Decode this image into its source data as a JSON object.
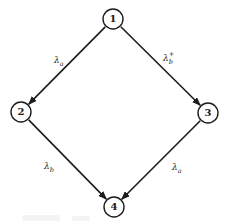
{
  "diagram": {
    "type": "state-transition-graph",
    "background": "#ffffff",
    "stroke_color": "#1c1c1c",
    "node_fill": "#ffffff",
    "node_radius": 10,
    "nodes": [
      {
        "id": "1",
        "label": "1",
        "x": 113,
        "y": 19
      },
      {
        "id": "2",
        "label": "2",
        "x": 21,
        "y": 112
      },
      {
        "id": "3",
        "label": "3",
        "x": 208,
        "y": 113
      },
      {
        "id": "4",
        "label": "4",
        "x": 114,
        "y": 207
      }
    ],
    "edges": [
      {
        "from": "1",
        "to": "2",
        "label_base": "λ",
        "label_sub": "a",
        "label_sup": "",
        "label_x": 54,
        "label_y": 63
      },
      {
        "from": "1",
        "to": "3",
        "label_base": "λ",
        "label_sub": "b",
        "label_sup": "+",
        "label_x": 163,
        "label_y": 61
      },
      {
        "from": "2",
        "to": "4",
        "label_base": "λ",
        "label_sub": "b",
        "label_sup": "",
        "label_x": 44,
        "label_y": 169
      },
      {
        "from": "3",
        "to": "4",
        "label_base": "λ",
        "label_sub": "a",
        "label_sup": "",
        "label_x": 172,
        "label_y": 170
      }
    ]
  }
}
